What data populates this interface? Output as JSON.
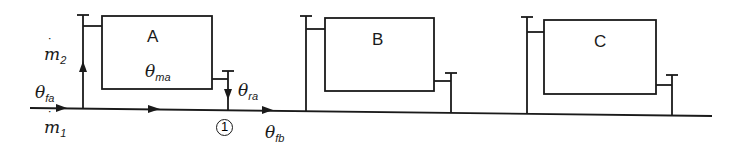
{
  "diagram": {
    "type": "heating-circuit-schematic",
    "stroke_color": "#1a1a1a",
    "background": "#ffffff",
    "radiators": [
      {
        "id": "A",
        "label": "A",
        "temperature_label": {
          "sym": "θ",
          "sub": "ma"
        }
      },
      {
        "id": "B",
        "label": "B"
      },
      {
        "id": "C",
        "label": "C"
      }
    ],
    "flows": {
      "m2": {
        "sym": "m",
        "sub": "2",
        "dot": "˙"
      },
      "m1": {
        "sym": "m",
        "sub": "1",
        "dot": "˙"
      }
    },
    "temperatures": {
      "theta_fa": {
        "sym": "θ",
        "sub": "fa"
      },
      "theta_ra": {
        "sym": "θ",
        "sub": "ra"
      },
      "theta_fb": {
        "sym": "θ",
        "sub": "fb"
      }
    },
    "node": {
      "label": "1"
    }
  }
}
